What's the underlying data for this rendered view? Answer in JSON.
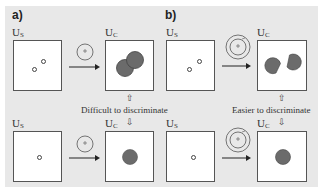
{
  "panels": {
    "a": {
      "label": "a)",
      "top": {
        "us_label": "U",
        "us_sub": "S",
        "uc_label": "U",
        "uc_sub": "C"
      },
      "bottom": {
        "us_label": "U",
        "us_sub": "S",
        "uc_label": "U",
        "uc_sub": "C"
      },
      "note": "Difficult to discriminate",
      "kernel": "single-circle-kernel"
    },
    "b": {
      "label": "b)",
      "top": {
        "us_label": "U",
        "us_sub": "S",
        "uc_label": "U",
        "uc_sub": "C"
      },
      "bottom": {
        "us_label": "U",
        "us_sub": "S",
        "uc_label": "U",
        "uc_sub": "C"
      },
      "note": "Easier to discriminate",
      "kernel": "double-ring-kernel"
    }
  },
  "arrows": {
    "up": "⇧",
    "down": "⇩"
  },
  "colors": {
    "background": "#e8e8e8",
    "blob": "#6b6b6b",
    "blob_border": "#444444",
    "box_border": "#555555"
  }
}
